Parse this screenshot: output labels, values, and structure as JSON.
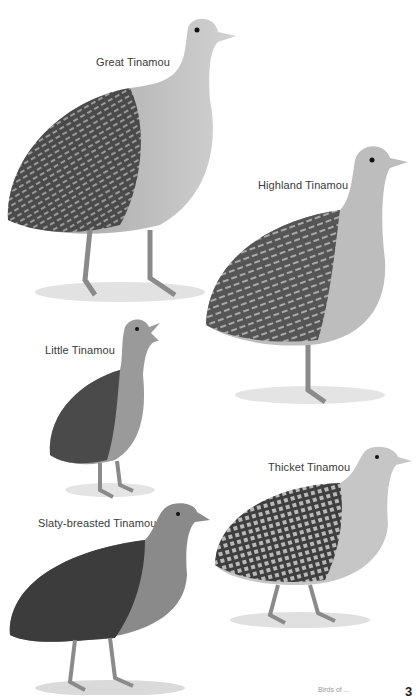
{
  "plate": {
    "species": [
      {
        "id": "great",
        "label": "Great Tinamou"
      },
      {
        "id": "highland",
        "label": "Highland Tinamou"
      },
      {
        "id": "little",
        "label": "Little Tinamou"
      },
      {
        "id": "thicket",
        "label": "Thicket Tinamou"
      },
      {
        "id": "slaty",
        "label": "Slaty-breasted Tinamou"
      }
    ],
    "footer": {
      "running_text": "Birds of ...",
      "page_number": "3"
    },
    "colors": {
      "background": "#ffffff",
      "label_text": "#3a3a3a",
      "dark_plumage": "#3c3c3c",
      "mid_plumage": "#7a7a7a",
      "light_breast": "#c9c9c9",
      "ground_shadow": "#dcdcdc"
    }
  }
}
